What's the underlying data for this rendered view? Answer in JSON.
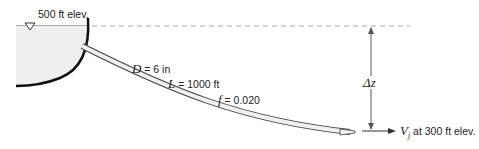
{
  "figure": {
    "reservoir": {
      "elevation_label": "500 ft elev.",
      "water_level_symbol": "inverted-triangle"
    },
    "pipe": {
      "diameter": {
        "symbol": "D",
        "equals": " = 6 in"
      },
      "length": {
        "symbol": "L",
        "equals": " = 1000 ft"
      },
      "friction": {
        "symbol": "f",
        "equals": " = 0.020"
      }
    },
    "height_difference": {
      "symbol": "Δz"
    },
    "jet": {
      "symbol": "V",
      "subscript": "j",
      "label": " at 300 ft elev."
    },
    "colors": {
      "water_fill": "#efefef",
      "line": "#111111",
      "dim_line": "#555555",
      "dash": "#aaaaaa"
    }
  }
}
